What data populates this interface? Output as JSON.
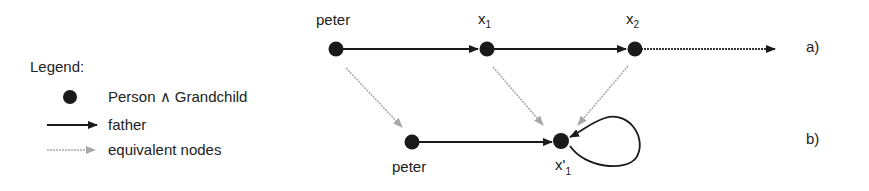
{
  "legend": {
    "title": "Legend:",
    "items": [
      {
        "icon": "filled-circle",
        "label": "Person ∧ Grandchild"
      },
      {
        "icon": "solid-arrow",
        "label": "father"
      },
      {
        "icon": "dotted-gray-arrow",
        "label": "equivalent nodes"
      }
    ]
  },
  "diagram_a": {
    "label": "a)",
    "nodes": [
      {
        "id": "peter",
        "label": "peter"
      },
      {
        "id": "x1",
        "label": "x",
        "subscript": "1"
      },
      {
        "id": "x2",
        "label": "x",
        "subscript": "2"
      }
    ],
    "edges": [
      {
        "from": "peter",
        "to": "x1",
        "type": "father"
      },
      {
        "from": "x1",
        "to": "x2",
        "type": "father"
      },
      {
        "from": "x2",
        "to": "continuation",
        "type": "dotted-infinite"
      }
    ]
  },
  "diagram_b": {
    "label": "b)",
    "nodes": [
      {
        "id": "peter_b",
        "label": "peter"
      },
      {
        "id": "x1prime",
        "label": "x'",
        "subscript": "1"
      }
    ],
    "edges": [
      {
        "from": "peter_b",
        "to": "x1prime",
        "type": "father"
      },
      {
        "from": "x1prime",
        "to": "x1prime",
        "type": "father-self-loop"
      }
    ]
  },
  "equivalences": [
    {
      "from": "peter",
      "to": "peter_b"
    },
    {
      "from": "x1",
      "to": "x1prime"
    },
    {
      "from": "x2",
      "to": "x1prime"
    }
  ],
  "colors": {
    "node": "#1a1a1a",
    "edge": "#1a1a1a",
    "equivalence": "#9a9a9a"
  }
}
